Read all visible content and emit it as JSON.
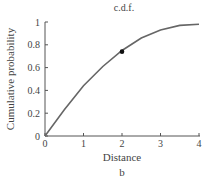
{
  "chart_data": {
    "type": "line",
    "title": "c.d.f.",
    "subtitle": "b",
    "xlabel": "Distance",
    "ylabel": "Cumulative probability",
    "xlim": [
      0,
      4
    ],
    "ylim": [
      0,
      1
    ],
    "x_ticks": [
      "0",
      "1",
      "2",
      "3",
      "4"
    ],
    "y_ticks": [
      "0",
      "0.2",
      "0.4",
      "0.6",
      "0.8",
      "1"
    ],
    "grid": false,
    "series": [
      {
        "name": "c.d.f.",
        "x": [
          0,
          0.5,
          1,
          1.5,
          2,
          2.5,
          3,
          3.5,
          4
        ],
        "y": [
          0,
          0.23,
          0.44,
          0.61,
          0.75,
          0.86,
          0.93,
          0.97,
          0.98
        ]
      }
    ],
    "annotations": [
      {
        "type": "point",
        "x": 2,
        "y": 0.74
      }
    ]
  },
  "colors": {
    "curve": "#666666",
    "axis": "#555555",
    "point": "#111111"
  }
}
